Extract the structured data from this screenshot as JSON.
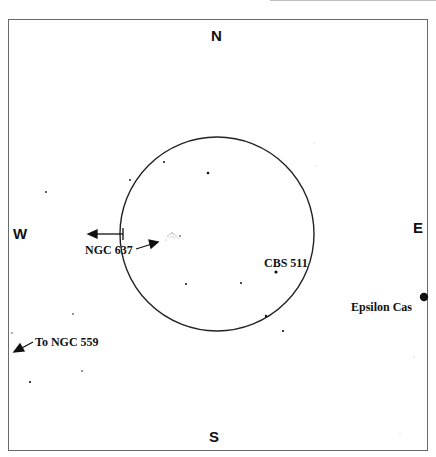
{
  "chart_data": {
    "type": "diagram",
    "directions": {
      "north": "N",
      "south": "S",
      "east": "E",
      "west": "W"
    },
    "field_circle": {
      "cx": 217,
      "cy": 234,
      "r": 97
    },
    "labels": {
      "ngc637": "NGC  637",
      "cbs511": "CBS 511",
      "epsilon_cas": "Epsilon  Cas",
      "to_ngc559": "To  NGC  559"
    },
    "stars": [
      {
        "x": 208,
        "y": 173,
        "r": 1.3
      },
      {
        "x": 164,
        "y": 162,
        "r": 1.0
      },
      {
        "x": 130,
        "y": 180,
        "r": 0.9
      },
      {
        "x": 46,
        "y": 192,
        "r": 0.9
      },
      {
        "x": 186,
        "y": 284,
        "r": 1.0
      },
      {
        "x": 241,
        "y": 283,
        "r": 1.0
      },
      {
        "x": 276,
        "y": 272,
        "r": 1.6
      },
      {
        "x": 266,
        "y": 316,
        "r": 1.2
      },
      {
        "x": 283,
        "y": 331,
        "r": 1.1
      },
      {
        "x": 424,
        "y": 297,
        "r": 4.2
      },
      {
        "x": 73,
        "y": 314,
        "r": 0.8
      },
      {
        "x": 82,
        "y": 371,
        "r": 0.8
      },
      {
        "x": 30,
        "y": 382,
        "r": 1.1
      },
      {
        "x": 12,
        "y": 333,
        "r": 0.7
      },
      {
        "x": 180,
        "y": 236,
        "r": 0.8
      },
      {
        "x": 314,
        "y": 143,
        "r": 0.5
      },
      {
        "x": 316,
        "y": 166,
        "r": 0.5
      },
      {
        "x": 414,
        "y": 357,
        "r": 0.5
      },
      {
        "x": 400,
        "y": 434,
        "r": 0.5
      }
    ]
  }
}
